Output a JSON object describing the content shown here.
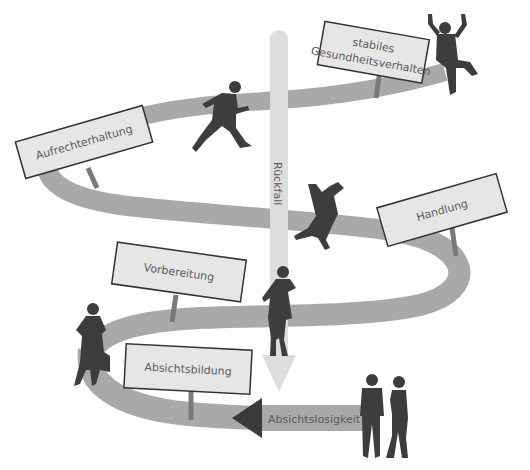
{
  "diagram": {
    "colors": {
      "background": "#ffffff",
      "road": "#a9a9a9",
      "relapse_arrow": "#dddddd",
      "sign_fill": "#e6e6e6",
      "sign_border": "#333333",
      "silhouette": "#3d3d3d",
      "text": "#5a5a5a"
    },
    "stages": [
      {
        "id": "absichtslosigkeit",
        "label": "Absichtslosigkeit",
        "order": 1
      },
      {
        "id": "absichtsbildung",
        "label": "Absichtsbildung",
        "order": 2
      },
      {
        "id": "vorbereitung",
        "label": "Vorbereitung",
        "order": 3
      },
      {
        "id": "handlung",
        "label": "Handlung",
        "order": 4
      },
      {
        "id": "aufrechterhaltung",
        "label": "Aufrechterhaltung",
        "order": 5
      },
      {
        "id": "stabiles",
        "label_line1": "stabiles",
        "label_line2": "Gesundheitsverhalten",
        "order": 6
      }
    ],
    "relapse": {
      "label": "Rückfall"
    },
    "figures": [
      {
        "name": "standing-couple",
        "stage": "Absichtslosigkeit"
      },
      {
        "name": "woman-with-bag",
        "stage": "Absichtsbildung"
      },
      {
        "name": "woman-on-phone",
        "stage": "Vorbereitung"
      },
      {
        "name": "falling-man",
        "stage": "Handlung"
      },
      {
        "name": "running-man",
        "stage": "Aufrechterhaltung"
      },
      {
        "name": "cheering-man",
        "stage": "stabiles Gesundheitsverhalten"
      }
    ]
  }
}
